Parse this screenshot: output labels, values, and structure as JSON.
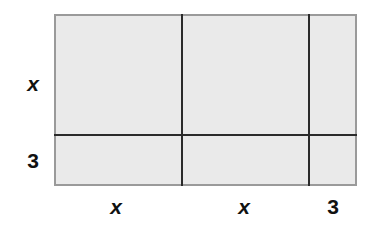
{
  "diagram": {
    "kind": "area-model-rectangle",
    "fill_color": "#eaeaea",
    "outer_border_color": "#9a9a9a",
    "partition_line_color": "#2b2b2b",
    "background_color": "#ffffff",
    "side_labels": {
      "left": [
        {
          "id": "row-1",
          "text": "x",
          "style": "italic"
        },
        {
          "id": "row-2",
          "text": "3",
          "style": "upright"
        }
      ],
      "bottom": [
        {
          "id": "col-1",
          "text": "x",
          "style": "italic"
        },
        {
          "id": "col-2",
          "text": "x",
          "style": "italic"
        },
        {
          "id": "col-3",
          "text": "3",
          "style": "upright"
        }
      ]
    },
    "columns": [
      {
        "id": "col-1",
        "label": "x"
      },
      {
        "id": "col-2",
        "label": "x"
      },
      {
        "id": "col-3",
        "label": "3"
      }
    ],
    "rows": [
      {
        "id": "row-1",
        "label": "x"
      },
      {
        "id": "row-2",
        "label": "3"
      }
    ]
  }
}
